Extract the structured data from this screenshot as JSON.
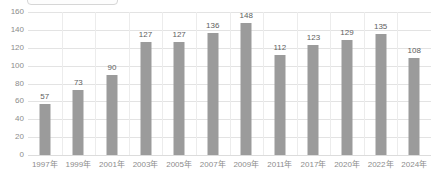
{
  "top_clipped_box": {
    "name": "clipped-rounded-box",
    "border_color": "#d6d6d6"
  },
  "chart_data": {
    "type": "bar",
    "title": "",
    "subtitle": "",
    "xlabel": "",
    "ylabel": "",
    "categories": [
      "1997年",
      "1999年",
      "2001年",
      "2003年",
      "2005年",
      "2007年",
      "2009年",
      "2011年",
      "2017年",
      "2020年",
      "2022年",
      "2024年"
    ],
    "values": [
      57,
      73,
      90,
      127,
      127,
      136,
      148,
      112,
      123,
      129,
      135,
      108
    ],
    "data_labels": [
      "57",
      "73",
      "90",
      "127",
      "127",
      "136",
      "148",
      "112",
      "123",
      "129",
      "135",
      "108"
    ],
    "ylim": [
      0,
      160
    ],
    "yticks": [
      0,
      20,
      40,
      60,
      80,
      100,
      120,
      140,
      160
    ],
    "ytick_labels": [
      "0",
      "20",
      "40",
      "60",
      "80",
      "100",
      "120",
      "140",
      "160"
    ],
    "grid": {
      "horizontal": true,
      "vertical": true
    },
    "legend": {
      "visible": false,
      "position": "none",
      "entries": []
    },
    "colors": {
      "bar": "#9b9b9b",
      "gridline": "#e3e3e3",
      "vertical_gridline": "#ececec",
      "axis_text": "#8c8c8c",
      "data_label_text": "#5e5e5e",
      "background": "#ffffff"
    }
  }
}
